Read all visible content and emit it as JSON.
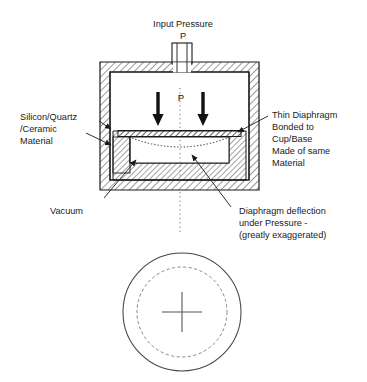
{
  "figure": {
    "title_top": "Input Pressure",
    "title_top_symbol": "P",
    "pressure_symbol_inner": "P",
    "labels": {
      "left_material_line1": "Silicon/Quartz",
      "left_material_line2": "/Ceramic",
      "left_material_line3": "Material",
      "vacuum": "Vacuum",
      "right_diaphragm_line1": "Thin Diaphragm",
      "right_diaphragm_line2": "Bonded to",
      "right_diaphragm_line3": "Cup/Base",
      "right_diaphragm_line4": "Made of same",
      "right_diaphragm_line5": "Material",
      "deflection_line1": "Diaphragm deflection",
      "deflection_line2": "under Pressure -",
      "deflection_line3": "(greatly exaggerated)"
    },
    "icons": {
      "pressure_arrow_left": "down-arrow-icon",
      "pressure_arrow_right": "down-arrow-icon",
      "center_cross": "crosshair-icon"
    },
    "colors": {
      "stroke": "#1a1a1a",
      "hatch": "#333333",
      "dotted": "#555555",
      "background": "#ffffff"
    }
  }
}
